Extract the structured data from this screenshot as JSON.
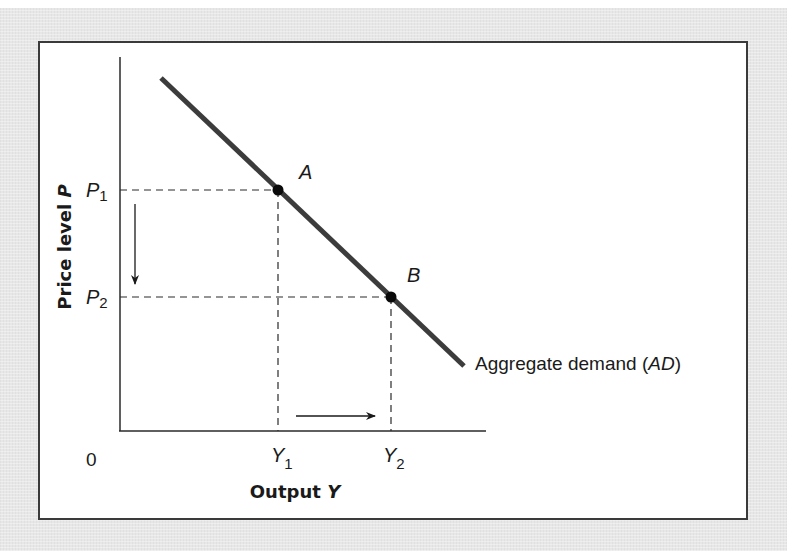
{
  "diagram": {
    "type": "economics-aggregate-demand",
    "y_axis_label": "Price level",
    "y_axis_var": "P",
    "x_axis_label": "Output",
    "x_axis_var": "Y",
    "origin_label": "0",
    "price_ticks": [
      {
        "symbol": "P",
        "sub": "1"
      },
      {
        "symbol": "P",
        "sub": "2"
      }
    ],
    "output_ticks": [
      {
        "symbol": "Y",
        "sub": "1"
      },
      {
        "symbol": "Y",
        "sub": "2"
      }
    ],
    "points": [
      {
        "label": "A",
        "at": "P1,Y1"
      },
      {
        "label": "B",
        "at": "P2,Y2"
      }
    ],
    "curve": {
      "label_text": "Aggregate demand (",
      "label_abbrev": "AD",
      "label_close": ")",
      "slope": "downward"
    },
    "arrows": [
      {
        "direction": "down",
        "meaning": "price level falls from P1 to P2"
      },
      {
        "direction": "right",
        "meaning": "output rises from Y1 to Y2"
      }
    ],
    "colors": {
      "curve": "#3c3c3c",
      "axes": "#2a2a2a",
      "dashed": "#2a2a2a",
      "frame_background": "#e7e7e7"
    }
  }
}
